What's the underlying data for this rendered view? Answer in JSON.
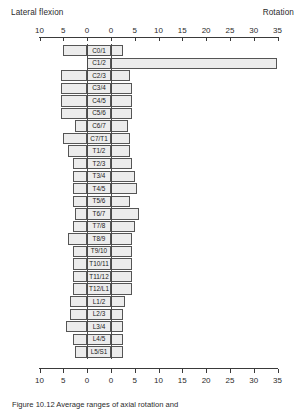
{
  "header": {
    "left_label": "Lateral flexion",
    "right_label": "Rotation"
  },
  "caption": {
    "text": "Figure 10.12  Average ranges of axial rotation and"
  },
  "chart_data": {
    "type": "bar",
    "orientation": "horizontal",
    "title": "",
    "subtitle": "",
    "xlabel_left": "Lateral flexion",
    "xlabel_right": "Rotation",
    "ylabel": "",
    "grid": false,
    "legend_position": "none",
    "axis_ticks": [
      10,
      5,
      0,
      0,
      5,
      10,
      15,
      20,
      25,
      30,
      35
    ],
    "left_axis_range": [
      0,
      10
    ],
    "right_axis_range": [
      0,
      35
    ],
    "categories": [
      "C0/1",
      "C1/2",
      "C2/3",
      "C3/4",
      "C4/5",
      "C5/6",
      "C6/7",
      "C7/T1",
      "T1/2",
      "T2/3",
      "T3/4",
      "T4/5",
      "T5/6",
      "T6/7",
      "T7/8",
      "T8/9",
      "T9/10",
      "T10/11",
      "T11/12",
      "T12/L1",
      "L1/2",
      "L2/3",
      "L3/4",
      "L4/5",
      "L5/S1"
    ],
    "series": [
      {
        "name": "Lateral flexion",
        "side": "left",
        "values": [
          5.0,
          0.0,
          5.5,
          5.5,
          5.5,
          5.5,
          2.5,
          5.0,
          4.0,
          3.0,
          3.0,
          3.0,
          3.0,
          2.5,
          3.0,
          4.0,
          3.0,
          3.0,
          3.0,
          3.0,
          3.5,
          3.5,
          4.5,
          3.0,
          2.5
        ]
      },
      {
        "name": "Rotation",
        "side": "right",
        "values": [
          2.5,
          35.0,
          4.0,
          4.5,
          4.5,
          4.5,
          3.5,
          4.0,
          4.0,
          4.5,
          5.0,
          5.5,
          4.0,
          6.0,
          5.0,
          4.5,
          4.5,
          4.5,
          4.5,
          4.5,
          3.0,
          2.5,
          2.5,
          2.5,
          2.5
        ]
      }
    ]
  }
}
